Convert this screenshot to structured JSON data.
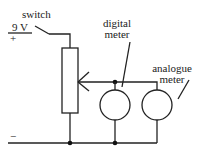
{
  "diagram": {
    "type": "circuit",
    "labels": {
      "switch": "switch",
      "voltage": "9 V",
      "plus": "+",
      "minus": "−",
      "digital_line1": "digital",
      "digital_line2": "meter",
      "analogue_line1": "analogue",
      "analogue_line2": "meter"
    },
    "components": [
      {
        "id": "battery",
        "kind": "supply",
        "value": "9 V"
      },
      {
        "id": "switch",
        "kind": "switch",
        "state": "open"
      },
      {
        "id": "potentiometer",
        "kind": "variable-resistor"
      },
      {
        "id": "digital-meter",
        "kind": "meter"
      },
      {
        "id": "analogue-meter",
        "kind": "meter"
      }
    ],
    "colors": {
      "line": "#222222",
      "background": "#ffffff"
    }
  }
}
